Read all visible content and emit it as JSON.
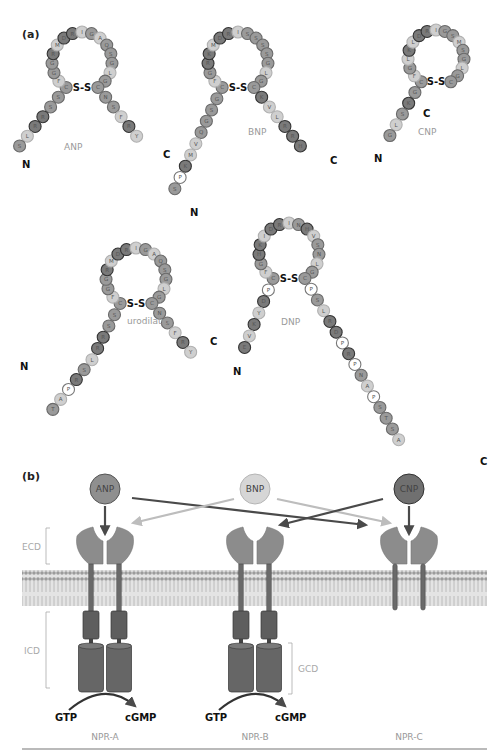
{
  "panels": {
    "a": {
      "label": "(a)"
    },
    "b": {
      "label": "(b)"
    }
  },
  "colors": {
    "dark": "#6e6e6e",
    "mid": "#8f8f8f",
    "light": "#c4c4c4",
    "white": "#ffffff",
    "arrow_dark": "#4a4a4a",
    "arrow_light": "#bdbdbd",
    "membrane": "#a9a9a9",
    "receptor": "#8a8a8a",
    "icd": "#5e5e5e"
  },
  "peptides": [
    {
      "name": "ANP",
      "n_label": "N",
      "c_label": "C",
      "bond": "S-S",
      "n_tail": [
        "S",
        "L",
        "R",
        "R",
        "S",
        "S"
      ],
      "loop": [
        "C",
        "F",
        "G",
        "G",
        "R",
        "M",
        "D",
        "R",
        "I",
        "G",
        "A",
        "Q",
        "S",
        "G",
        "L",
        "G",
        "C"
      ],
      "c_tail": [
        "N",
        "S",
        "F",
        "R",
        "Y"
      ]
    },
    {
      "name": "BNP",
      "n_label": "N",
      "c_label": "C",
      "bond": "S-S",
      "n_tail": [
        "S",
        "P",
        "K",
        "M",
        "V",
        "Q",
        "G",
        "S",
        "G"
      ],
      "loop": [
        "C",
        "F",
        "G",
        "R",
        "K",
        "M",
        "D",
        "R",
        "I",
        "S",
        "S",
        "S",
        "S",
        "G",
        "L",
        "G",
        "C"
      ],
      "c_tail": [
        "K",
        "V",
        "L",
        "R",
        "R",
        "H"
      ]
    },
    {
      "name": "CNP",
      "n_label": "N",
      "c_label": "C",
      "bond": "S-S",
      "n_tail": [
        "G",
        "L",
        "S",
        "K",
        "G"
      ],
      "loop": [
        "C",
        "F",
        "G",
        "L",
        "K",
        "L",
        "D",
        "R",
        "I",
        "G",
        "S",
        "M",
        "S",
        "G",
        "L",
        "G",
        "C"
      ],
      "c_tail": []
    },
    {
      "name": "urodilatin",
      "n_label": "N",
      "c_label": "C",
      "bond": "S-S",
      "n_tail": [
        "T",
        "A",
        "P",
        "R",
        "S",
        "L",
        "R",
        "R",
        "S",
        "S"
      ],
      "loop": [
        "C",
        "F",
        "G",
        "G",
        "R",
        "M",
        "D",
        "R",
        "I",
        "G",
        "A",
        "Q",
        "S",
        "G",
        "L",
        "G",
        "C"
      ],
      "c_tail": [
        "N",
        "S",
        "F",
        "R",
        "Y"
      ]
    },
    {
      "name": "DNP",
      "n_label": "N",
      "c_label": "C",
      "bond": "S-S",
      "n_tail": [
        "E",
        "V",
        "K",
        "Y",
        "D",
        "P"
      ],
      "loop": [
        "C",
        "F",
        "G",
        "H",
        "K",
        "I",
        "D",
        "R",
        "I",
        "N",
        "H",
        "V",
        "S",
        "N",
        "L",
        "G",
        "C"
      ],
      "c_tail": [
        "P",
        "S",
        "L",
        "R",
        "D",
        "P",
        "R",
        "P",
        "N",
        "A",
        "P",
        "S",
        "T",
        "S",
        "A"
      ]
    }
  ],
  "ligands": [
    {
      "name": "ANP",
      "shade": "mid"
    },
    {
      "name": "BNP",
      "shade": "light"
    },
    {
      "name": "CNP",
      "shade": "dark"
    }
  ],
  "receptors": [
    {
      "name": "NPR-A",
      "gtp": "GTP",
      "cgmp": "cGMP"
    },
    {
      "name": "NPR-B",
      "gtp": "GTP",
      "cgmp": "cGMP"
    },
    {
      "name": "NPR-C"
    }
  ],
  "domain_labels": {
    "ecd": "ECD",
    "icd": "ICD",
    "gcd": "GCD"
  }
}
